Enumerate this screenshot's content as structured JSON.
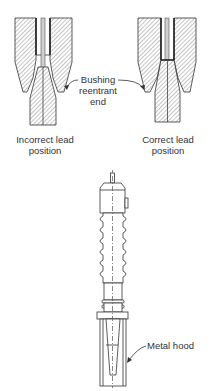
{
  "figure": {
    "panels": [
      {
        "id": "incorrect",
        "caption_line1": "Incorrect lead",
        "caption_line2": "position"
      },
      {
        "id": "correct",
        "caption_line1": "Correct lead",
        "caption_line2": "position"
      }
    ],
    "callout_bushing": {
      "line1": "Bushing",
      "line2": "reentrant",
      "line3": "end"
    },
    "callout_hood": {
      "text": "Metal hood"
    },
    "colors": {
      "stroke": "#333333",
      "hatch": "#8a8a8a",
      "background": "#ffffff"
    }
  }
}
